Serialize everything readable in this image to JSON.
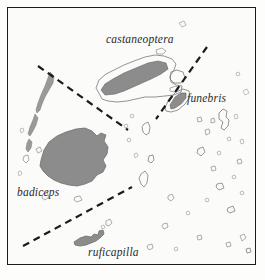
{
  "figure": {
    "background_color": "#fbfbfa",
    "frame_color": "#1b1b1b",
    "land_fill_color": "#8c8c8c",
    "land_outline_color": "#6b6b6b",
    "boundary_line_color": "#1b1b1b"
  },
  "labels": [
    {
      "id": "castaneoptera",
      "text": "castaneoptera",
      "style": "italic",
      "x": 106,
      "y": 33
    },
    {
      "id": "funebris",
      "text": "funebris",
      "style": "italic",
      "x": 187,
      "y": 92
    },
    {
      "id": "badiceps",
      "text": "badiceps",
      "style": "italic",
      "x": 17,
      "y": 186
    },
    {
      "id": "ruficapilla",
      "text": "ruficapilla",
      "style": "italic",
      "x": 88,
      "y": 246
    }
  ],
  "boundary_lines": [
    {
      "id": "northwest-boundary",
      "x1": 38,
      "y1": 66,
      "x2": 128,
      "y2": 130
    },
    {
      "id": "northeast-boundary",
      "x1": 207,
      "y1": 47,
      "x2": 156,
      "y2": 119
    },
    {
      "id": "south-boundary",
      "x1": 23,
      "y1": 246,
      "x2": 132,
      "y2": 187
    }
  ],
  "islands": [
    {
      "id": "viti-levu",
      "label": "badiceps",
      "fill": "shaded"
    },
    {
      "id": "vanua-levu",
      "label": "castaneoptera",
      "fill": "shaded-with-outline"
    },
    {
      "id": "taveuni",
      "label": "funebris",
      "fill": "shaded"
    },
    {
      "id": "kadavu",
      "label": "ruficapilla",
      "fill": "shaded"
    },
    {
      "id": "yasawa-chain",
      "label": "badiceps",
      "fill": "outline"
    },
    {
      "id": "lomaiviti-group",
      "label": "",
      "fill": "outline"
    },
    {
      "id": "lau-group",
      "label": "",
      "fill": "outline"
    }
  ]
}
